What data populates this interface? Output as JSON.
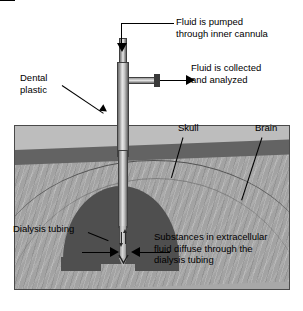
{
  "figure": {
    "width": 303,
    "height": 311,
    "background": "#ffffff"
  },
  "colors": {
    "page_background": "#ffffff",
    "tissue_background": "#a8a8a8",
    "scalp_layer": "#bdbdbd",
    "skull_layer": "#636363",
    "brain_layer": "#a3a3a3",
    "dental_plastic": "#4f4f4f",
    "cannula_metal_light": "#e8e8e8",
    "cannula_metal_dark": "#5c5c5c",
    "line_and_text": "#000000",
    "box_border": "#4a4a4a"
  },
  "labels": {
    "fluid_pumped": "Fluid is pumped\nthrough inner cannula",
    "fluid_collected": "Fluid is collected\nand analyzed",
    "dental_plastic": "Dental\nplastic",
    "skull": "Skull",
    "brain": "Brain",
    "dialysis_tubing": "Dialysis tubing",
    "substances_diffuse": "Substances in extracellular\nfluid diffuse through the\ndialysis tubing"
  },
  "parts": {
    "inner_cannula": "inner-cannula",
    "outer_cannula": "outer-cannula",
    "side_collection_arm": "collection-outlet-arm",
    "probe_shaft": "probe-shaft",
    "dialysis_membrane": "dialysis-tubing-membrane",
    "probe_tip": "probe-tip"
  },
  "annotations": {
    "inflow_arrow": "down-arrow-inflow",
    "outflow_arrow": "right-arrow-outflow",
    "diffusion_arrow_left": "right-arrow-diffusion-left",
    "diffusion_arrow_right": "left-arrow-diffusion-right",
    "tubing_flow_down": "down-arrow-tubing-flow",
    "tubing_flow_up": "up-arrow-tubing-flow"
  }
}
